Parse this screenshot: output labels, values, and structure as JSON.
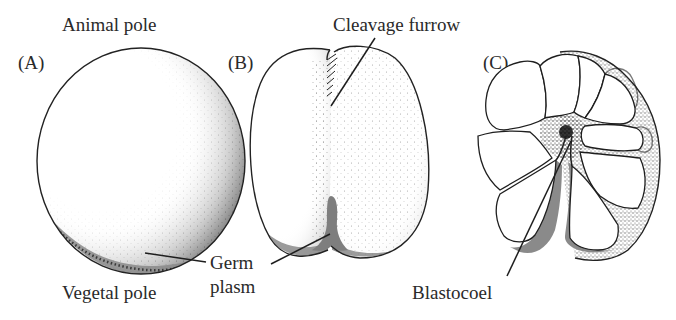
{
  "figure": {
    "panels": [
      {
        "id": "A",
        "label": "(A)",
        "description": "Uncleaved egg"
      },
      {
        "id": "B",
        "label": "(B)",
        "description": "First cleavage"
      },
      {
        "id": "C",
        "label": "(C)",
        "description": "Multicellular embryo (section)"
      }
    ],
    "labels": {
      "animal_pole": "Animal pole",
      "vegetal_pole": "Vegetal pole",
      "cleavage_furrow": "Cleavage furrow",
      "germ_plasm_line1": "Germ",
      "germ_plasm_line2": "plasm",
      "blastocoel": "Blastocoel"
    },
    "colors": {
      "outline": "#1e1e1e",
      "stipple": "#3a3a3a",
      "germ_plasm": "#8a8a8a",
      "background": "#ffffff",
      "text": "#2a2a2a"
    }
  }
}
